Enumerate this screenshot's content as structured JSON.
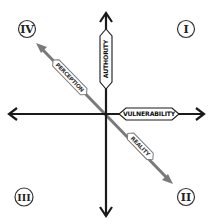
{
  "diagram": {
    "type": "quadrant",
    "axes": {
      "vertical": {
        "label": "AUTHORITY",
        "direction": "bidirectional"
      },
      "horizontal": {
        "label": "VULNERABILITY",
        "direction": "bidirectional"
      }
    },
    "diagonal": {
      "upper_label": "PERCEPTION",
      "lower_label": "REALITY",
      "color": "#7a7a7a"
    },
    "quadrants": {
      "top_left": "IV",
      "top_right": "I",
      "bottom_left": "III",
      "bottom_right": "II"
    },
    "colors": {
      "axis": "#1a1a1a",
      "diagonal": "#7a7a7a",
      "background": "#ffffff"
    }
  }
}
